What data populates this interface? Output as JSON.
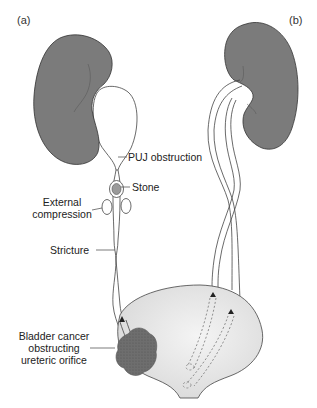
{
  "figure": {
    "panels": [
      {
        "id": "a",
        "label": "(a)"
      },
      {
        "id": "b",
        "label": "(b)"
      }
    ],
    "annotations": {
      "puj": "PUJ obstruction",
      "stone": "Stone",
      "external_line1": "External",
      "external_line2": "compression",
      "stricture": "Stricture",
      "bladder_line1": "Bladder cancer",
      "bladder_line2": "obstructing",
      "bladder_line3": "ureteric orifice"
    },
    "colors": {
      "kidney": "#7b7b7b",
      "bladder_fill": "#e4e4e4",
      "tumour": "#6e6e6e",
      "stone": "#9a9a9a",
      "outline": "#333333"
    }
  }
}
